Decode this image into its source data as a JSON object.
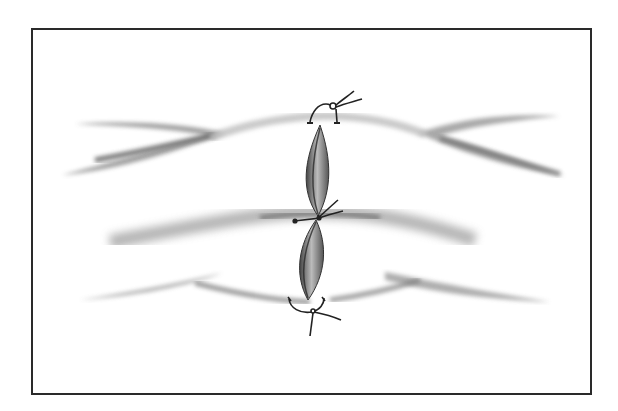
{
  "figure": {
    "type": "illustration",
    "colors": {
      "frame": "#2a2a2a",
      "background": "#ffffff",
      "shade_dark": "#555555",
      "shade_mid": "#9a9a9a",
      "suture": "#222222"
    },
    "sutures": [
      {
        "name": "top-suture",
        "x": 332,
        "y": 106
      },
      {
        "name": "middle-suture",
        "x": 318,
        "y": 216
      },
      {
        "name": "bottom-suture",
        "x": 308,
        "y": 310
      }
    ]
  }
}
